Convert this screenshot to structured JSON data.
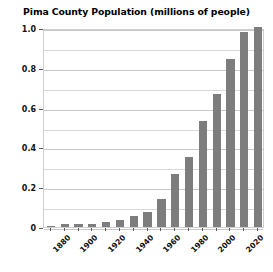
{
  "chart_data": {
    "type": "bar",
    "title": "Pima County Population (millions of people)",
    "xlabel": "",
    "ylabel": "",
    "ylim": [
      0,
      1.0
    ],
    "grid": true,
    "legend": "none",
    "bar_color": "#7d7d7d",
    "y_ticks": [
      "0",
      "0.2",
      "0.4",
      "0.6",
      "0.8",
      "1.0"
    ],
    "y_tick_values": [
      0,
      0.2,
      0.4,
      0.6,
      0.8,
      1.0
    ],
    "y_minor_step": 0.1,
    "x_tick_labels": [
      "1880",
      "1900",
      "1920",
      "1940",
      "1960",
      "1980",
      "2000",
      "2020"
    ],
    "categories": [
      "1870",
      "1880",
      "1890",
      "1900",
      "1910",
      "1920",
      "1930",
      "1940",
      "1950",
      "1960",
      "1970",
      "1980",
      "1990",
      "2000",
      "2010",
      "2020"
    ],
    "values": [
      0.006,
      0.013,
      0.013,
      0.015,
      0.023,
      0.035,
      0.056,
      0.073,
      0.142,
      0.266,
      0.352,
      0.532,
      0.667,
      0.844,
      0.981,
      1.005
    ]
  }
}
